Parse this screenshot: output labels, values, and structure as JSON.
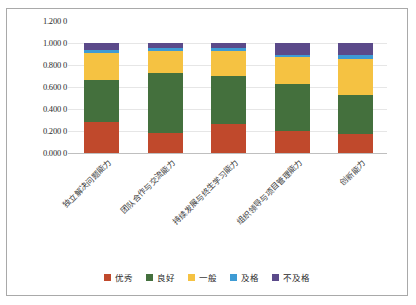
{
  "chart_data": {
    "type": "bar",
    "subtype": "stacked-100",
    "title": "",
    "xlabel": "",
    "ylabel": "",
    "ylim": [
      0,
      1.2
    ],
    "grid": true,
    "legend_position": "bottom",
    "y_ticks": [
      0,
      0.2,
      0.4,
      0.6,
      0.8,
      1.0,
      1.2
    ],
    "y_tick_labels": [
      "0.000 0",
      "0.200 0",
      "0.400 0",
      "0.600 0",
      "0.800 0",
      "1.000 0",
      "1.200 0"
    ],
    "categories": [
      "独立解决问题能力",
      "团队合作与交流能力",
      "持续发展与终生学习能力",
      "组织领导与项目管理能力",
      "创新能力"
    ],
    "series": [
      {
        "name": "优秀",
        "color": "#C0492C",
        "values": [
          0.285,
          0.185,
          0.265,
          0.2,
          0.175
        ]
      },
      {
        "name": "良好",
        "color": "#44703D",
        "values": [
          0.38,
          0.545,
          0.435,
          0.425,
          0.35
        ]
      },
      {
        "name": "一般",
        "color": "#F5C242",
        "values": [
          0.245,
          0.195,
          0.225,
          0.25,
          0.33
        ]
      },
      {
        "name": "及格",
        "color": "#3E9BD4",
        "values": [
          0.03,
          0.03,
          0.03,
          0.02,
          0.04
        ]
      },
      {
        "name": "不及格",
        "color": "#5B4A8A",
        "values": [
          0.06,
          0.045,
          0.045,
          0.105,
          0.105
        ]
      }
    ]
  },
  "legend": {
    "items": [
      {
        "label": "优秀",
        "color": "#C0492C"
      },
      {
        "label": "良好",
        "color": "#44703D"
      },
      {
        "label": "一般",
        "color": "#F5C242"
      },
      {
        "label": "及格",
        "color": "#3E9BD4"
      },
      {
        "label": "不及格",
        "color": "#5B4A8A"
      }
    ]
  },
  "colors": {
    "frame_border": "#a9a9a9",
    "grid": "#e6e6e6",
    "background": "#ffffff",
    "text": "#2b2b2b"
  }
}
